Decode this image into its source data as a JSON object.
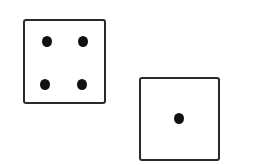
{
  "dice": [
    {
      "label": "die-four",
      "value": 4,
      "box": {
        "x": 23,
        "y": 19,
        "w": 83,
        "h": 85
      },
      "pips": [
        {
          "x": 47,
          "y": 41
        },
        {
          "x": 83,
          "y": 41
        },
        {
          "x": 45,
          "y": 84
        },
        {
          "x": 82,
          "y": 84
        }
      ]
    },
    {
      "label": "die-one",
      "value": 1,
      "box": {
        "x": 139,
        "y": 77,
        "w": 81,
        "h": 84
      },
      "pips": [
        {
          "x": 179,
          "y": 118
        }
      ]
    }
  ],
  "colors": {
    "outline": "#2a2a2a",
    "pip": "#111111",
    "background": "#ffffff"
  }
}
